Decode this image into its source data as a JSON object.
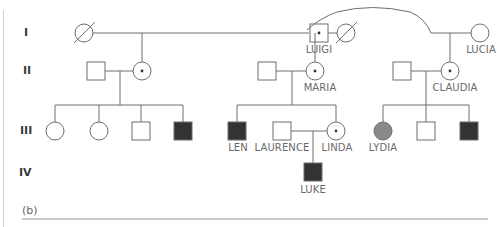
{
  "figure": {
    "panel_label": "(b)",
    "colors": {
      "line": "#6e6e6e",
      "affected_fill": "#333333",
      "partial_fill": "#8a8a8a",
      "unaffected_fill": "#ffffff",
      "label_text": "#6a6a6a"
    }
  },
  "generations": [
    {
      "label": "I"
    },
    {
      "label": "II"
    },
    {
      "label": "III"
    },
    {
      "label": "IV"
    }
  ],
  "individuals": {
    "luigi": {
      "name": "LUIGI",
      "sex": "male",
      "status": "carrier"
    },
    "lucia": {
      "name": "LUCIA",
      "sex": "female",
      "status": "unaffected"
    },
    "maria": {
      "name": "MARIA",
      "sex": "female",
      "status": "carrier"
    },
    "claudia": {
      "name": "CLAUDIA",
      "sex": "female",
      "status": "carrier"
    },
    "len": {
      "name": "LEN",
      "sex": "male",
      "status": "affected"
    },
    "laurence": {
      "name": "LAURENCE",
      "sex": "male",
      "status": "unaffected"
    },
    "linda": {
      "name": "LINDA",
      "sex": "female",
      "status": "carrier"
    },
    "lydia": {
      "name": "LYDIA",
      "sex": "female",
      "status": "affected-grey"
    },
    "luke": {
      "name": "LUKE",
      "sex": "male",
      "status": "affected"
    }
  }
}
